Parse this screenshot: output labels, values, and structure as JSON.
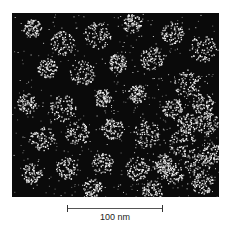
{
  "figure": {
    "type": "electron micrograph",
    "background": "#0a0a0a",
    "particle_color": "#e8e8e8"
  },
  "scale_bar": {
    "label": "100 nm",
    "length_px": 96
  }
}
